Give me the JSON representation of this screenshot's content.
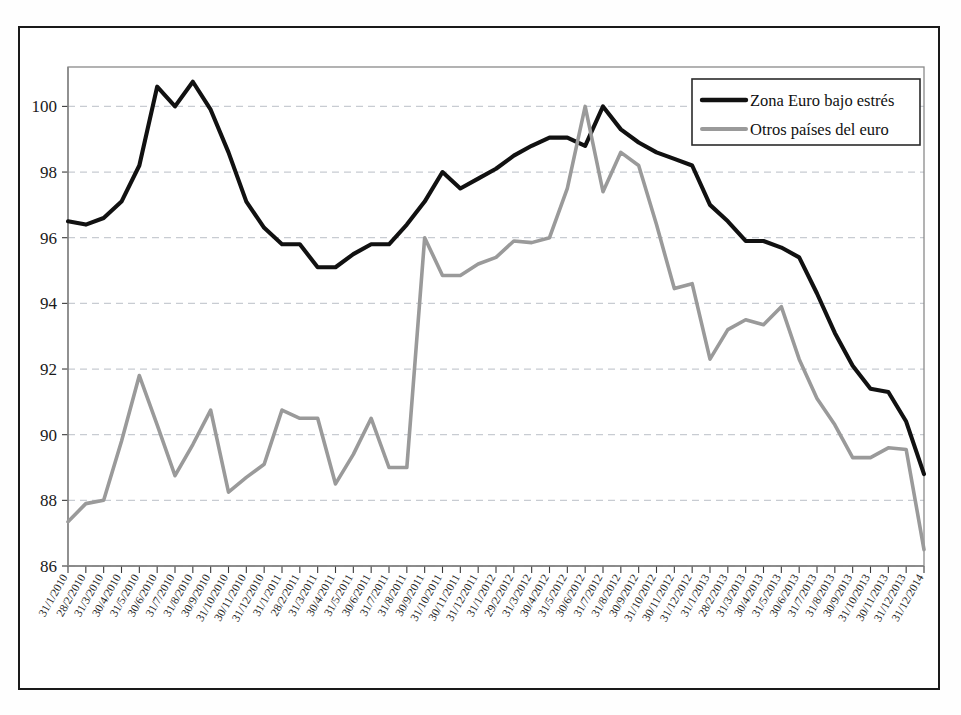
{
  "chart_data": {
    "type": "line",
    "title": "",
    "xlabel": "",
    "ylabel": "",
    "ylim": [
      86,
      101.2
    ],
    "yticks": [
      86,
      88,
      90,
      92,
      94,
      96,
      98,
      100
    ],
    "grid": true,
    "legend_position": "top-right",
    "colors": {
      "series_1": "#111111",
      "series_2": "#9a9a9a"
    },
    "categories": [
      "31/1/2010",
      "28/2/2010",
      "31/3/2010",
      "30/4/2010",
      "31/5/2010",
      "30/6/2010",
      "31/7/2010",
      "31/8/2010",
      "30/9/2010",
      "31/10/2010",
      "30/11/2010",
      "31/12/2010",
      "31/1/2011",
      "28/2/2011",
      "31/3/2011",
      "30/4/2011",
      "31/5/2011",
      "30/6/2011",
      "31/7/2011",
      "31/8/2011",
      "30/9/2011",
      "31/10/2011",
      "30/11/2011",
      "31/12/2011",
      "31/1/2012",
      "29/2/2012",
      "31/3/2012",
      "30/4/2012",
      "31/5/2012",
      "30/6/2012",
      "31/7/2012",
      "31/8/2012",
      "30/9/2012",
      "31/10/2012",
      "30/11/2012",
      "31/12/2012",
      "31/1/2013",
      "28/2/2013",
      "31/3/2013",
      "30/4/2013",
      "31/5/2013",
      "30/6/2013",
      "31/7/2013",
      "31/8/2013",
      "30/9/2013",
      "31/10/2013",
      "30/11/2013",
      "31/12/2013",
      "31/12/2014"
    ],
    "series": [
      {
        "name": "Zona Euro bajo estrés",
        "color": "#111111",
        "values": [
          96.5,
          96.4,
          96.6,
          97.1,
          98.2,
          100.6,
          100.0,
          100.75,
          99.9,
          98.6,
          97.1,
          96.3,
          95.8,
          95.8,
          95.1,
          95.1,
          95.5,
          95.8,
          95.8,
          96.4,
          97.1,
          98.0,
          97.5,
          97.8,
          98.1,
          98.5,
          98.8,
          99.05,
          99.05,
          98.8,
          100.0,
          99.3,
          98.9,
          98.6,
          98.4,
          98.2,
          97.0,
          96.5,
          95.9,
          95.9,
          95.7,
          95.4,
          94.3,
          93.1,
          92.1,
          91.4,
          91.3,
          90.4,
          88.8
        ]
      },
      {
        "name": "Otros países del euro",
        "color": "#9a9a9a",
        "values": [
          87.35,
          87.9,
          88.0,
          89.8,
          91.8,
          90.3,
          88.75,
          89.7,
          90.75,
          88.25,
          88.7,
          89.1,
          90.75,
          90.5,
          90.5,
          88.5,
          89.4,
          90.5,
          89.0,
          89.0,
          96.0,
          94.85,
          94.85,
          95.2,
          95.4,
          95.9,
          95.85,
          96.0,
          97.5,
          100.0,
          97.4,
          98.6,
          98.2,
          96.4,
          94.45,
          94.6,
          92.3,
          93.2,
          93.5,
          93.35,
          93.9,
          92.3,
          91.1,
          90.3,
          89.3,
          89.3,
          89.6,
          89.55,
          86.5
        ]
      }
    ]
  }
}
